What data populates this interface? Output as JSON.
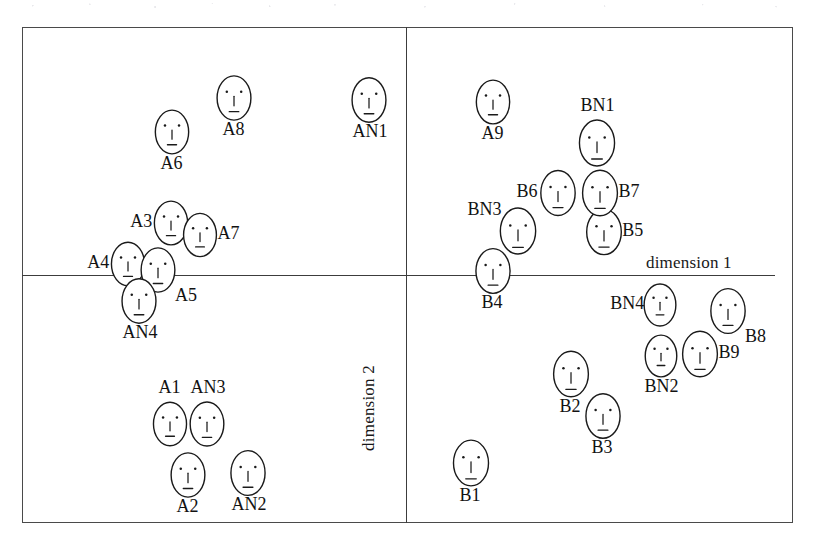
{
  "figure": {
    "type": "mds-face-scatter",
    "axes": {
      "dimension1_label": "dimension 1",
      "dimension2_label": "dimension 2"
    }
  },
  "chart_data": {
    "type": "scatter",
    "title": "",
    "subtitle": "",
    "xlabel": "dimension 1",
    "ylabel": "dimension 2",
    "grid": false,
    "legend": null,
    "marker": "chernoff-face-glyph",
    "axis_origin_px": {
      "x": 406,
      "y": 275
    },
    "xlim": [
      -384,
      369
    ],
    "ylim": [
      -248,
      248
    ],
    "note": "Axis values are expressed in pixel offsets from the crossing point of the two unlabeled axes; no numeric tick labels are printed on the figure.",
    "points": [
      {
        "label": "A1",
        "group": "A",
        "x": -238,
        "y": 147,
        "label_pos": "top"
      },
      {
        "label": "A2",
        "group": "A",
        "x": -220,
        "y": 198,
        "label_pos": "bottom"
      },
      {
        "label": "A3",
        "group": "A",
        "x": -237,
        "y": -54,
        "label_pos": "left"
      },
      {
        "label": "A4",
        "group": "A",
        "x": -280,
        "y": -13,
        "label_pos": "left"
      },
      {
        "label": "A5",
        "group": "A",
        "x": -250,
        "y": -7,
        "label_pos": "bottom-right"
      },
      {
        "label": "A6",
        "group": "A",
        "x": -236,
        "y": -145,
        "label_pos": "bottom"
      },
      {
        "label": "A7",
        "group": "A",
        "x": -208,
        "y": -42,
        "label_pos": "right"
      },
      {
        "label": "A8",
        "group": "A",
        "x": -174,
        "y": -179,
        "label_pos": "bottom"
      },
      {
        "label": "A9",
        "group": "A",
        "x": 85,
        "y": -175,
        "label_pos": "bottom"
      },
      {
        "label": "AN1",
        "group": "AN",
        "x": -39,
        "y": -177,
        "label_pos": "bottom"
      },
      {
        "label": "AN2",
        "group": "AN",
        "x": -160,
        "y": 196,
        "label_pos": "bottom"
      },
      {
        "label": "AN3",
        "group": "AN",
        "x": -201,
        "y": 147,
        "label_pos": "top"
      },
      {
        "label": "AN4",
        "group": "AN",
        "x": -269,
        "y": 24,
        "label_pos": "bottom"
      },
      {
        "label": "B1",
        "group": "B",
        "x": 63,
        "y": 186,
        "label_pos": "bottom"
      },
      {
        "label": "B2",
        "group": "B",
        "x": 163,
        "y": 97,
        "label_pos": "bottom"
      },
      {
        "label": "B3",
        "group": "B",
        "x": 195,
        "y": 139,
        "label_pos": "bottom"
      },
      {
        "label": "B4",
        "group": "B",
        "x": 85,
        "y": -6,
        "label_pos": "bottom"
      },
      {
        "label": "B5",
        "group": "B",
        "x": 196,
        "y": -45,
        "label_pos": "right"
      },
      {
        "label": "B6",
        "group": "B",
        "x": 150,
        "y": -84,
        "label_pos": "left"
      },
      {
        "label": "B7",
        "group": "B",
        "x": 192,
        "y": -84,
        "label_pos": "right"
      },
      {
        "label": "B8",
        "group": "B",
        "x": 320,
        "y": 34,
        "label_pos": "bottom-right"
      },
      {
        "label": "B9",
        "group": "B",
        "x": 292,
        "y": 77,
        "label_pos": "right"
      },
      {
        "label": "BN1",
        "group": "BN",
        "x": 189,
        "y": -134,
        "label_pos": "top"
      },
      {
        "label": "BN2",
        "group": "BN",
        "x": 253,
        "y": 79,
        "label_pos": "bottom"
      },
      {
        "label": "BN3",
        "group": "BN",
        "x": 110,
        "y": -46,
        "label_pos": "top-left"
      },
      {
        "label": "BN4",
        "group": "BN",
        "x": 252,
        "y": 28,
        "label_pos": "left"
      }
    ]
  },
  "colors": {
    "ink": "#1a1a1a",
    "frame": "#4a4a4a",
    "axis": "#3c3c3c",
    "paper": "#ffffff"
  }
}
